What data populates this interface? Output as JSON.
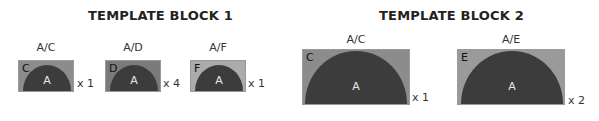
{
  "blocks": [
    {
      "title": "TEMPLATE BLOCK 1",
      "tiles": [
        {
          "label": "A/C",
          "corner": "C",
          "center": "A",
          "multiplier": "x 1",
          "bg": "#8c8c8c"
        },
        {
          "label": "A/D",
          "corner": "D",
          "center": "A",
          "multiplier": "x 4",
          "bg": "#7a7a7a"
        },
        {
          "label": "A/F",
          "corner": "F",
          "center": "A",
          "multiplier": "x 1",
          "bg": "#ababab"
        }
      ]
    },
    {
      "title": "TEMPLATE BLOCK 2",
      "tiles": [
        {
          "label": "A/C",
          "corner": "C",
          "center": "A",
          "multiplier": "x 1",
          "bg": "#8c8c8c"
        },
        {
          "label": "A/E",
          "corner": "E",
          "center": "A",
          "multiplier": "x 2",
          "bg": "#9a9a9a"
        }
      ]
    }
  ]
}
